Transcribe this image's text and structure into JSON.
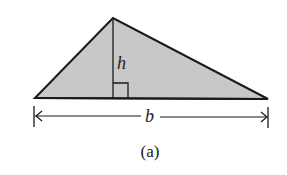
{
  "figure": {
    "caption": "(a)",
    "height_label": "h",
    "base_label": "b",
    "colors": {
      "fill": "#c8c8c8",
      "stroke": "#1a1a1a",
      "background": "#ffffff"
    },
    "triangle": {
      "left_vertex": [
        35,
        98
      ],
      "apex": [
        113,
        18
      ],
      "right_vertex": [
        268,
        99
      ]
    },
    "altitude": {
      "x": 113,
      "top": 18,
      "bottom": 98,
      "right_angle_size": 15
    },
    "base_dimension": {
      "y": 116,
      "x_start": 34,
      "x_end": 268
    }
  }
}
